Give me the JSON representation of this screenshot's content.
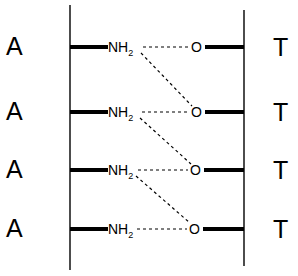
{
  "diagram": {
    "type": "hydrogen-bonding-ladder",
    "left_strand_base": "A",
    "right_strand_base": "T",
    "pairs": [
      {
        "left_base": "A",
        "right_base": "T",
        "donor": "NH",
        "donor_sub": "2",
        "acceptor": "O"
      },
      {
        "left_base": "A",
        "right_base": "T",
        "donor": "NH",
        "donor_sub": "2",
        "acceptor": "O"
      },
      {
        "left_base": "A",
        "right_base": "T",
        "donor": "NH",
        "donor_sub": "2",
        "acceptor": "O"
      },
      {
        "left_base": "A",
        "right_base": "T",
        "donor": "NH",
        "donor_sub": "2",
        "acceptor": "O"
      }
    ],
    "bonds": [
      {
        "from": 0,
        "to": 0,
        "style": "dashed"
      },
      {
        "from": 0,
        "to": 1,
        "style": "dashed"
      },
      {
        "from": 1,
        "to": 1,
        "style": "dashed"
      },
      {
        "from": 1,
        "to": 2,
        "style": "dashed"
      },
      {
        "from": 2,
        "to": 2,
        "style": "dashed"
      },
      {
        "from": 2,
        "to": 3,
        "style": "dashed"
      },
      {
        "from": 3,
        "to": 3,
        "style": "dashed"
      }
    ],
    "colors": {
      "line": "#000000",
      "background": "#ffffff"
    }
  }
}
